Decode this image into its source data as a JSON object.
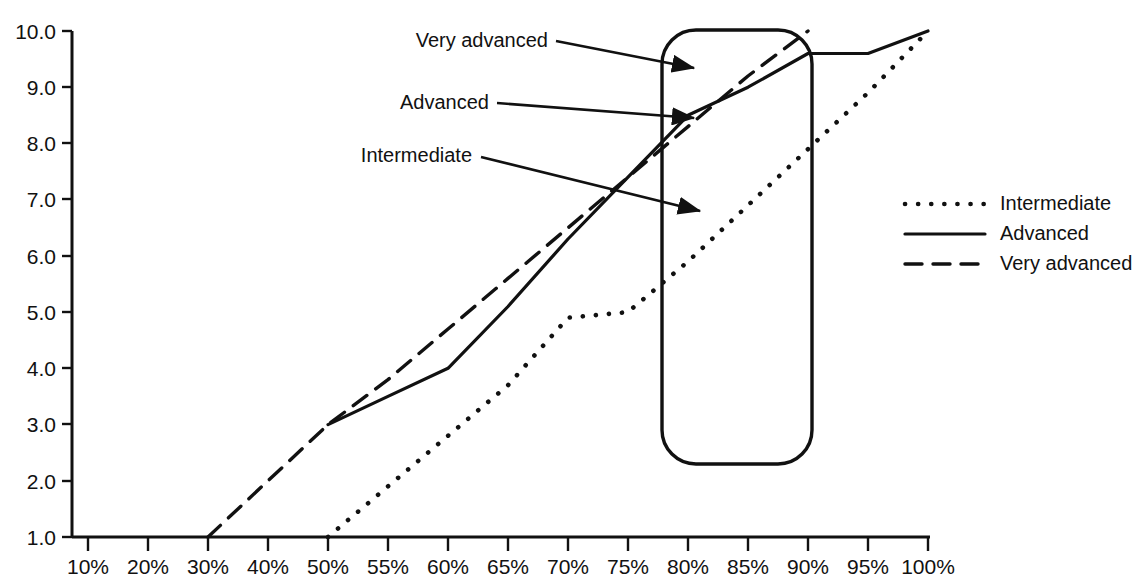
{
  "chart_data": {
    "type": "line",
    "title": "",
    "xlabel": "",
    "ylabel": "",
    "grid": false,
    "legend_position": "right",
    "x_tick_labels": [
      "10%",
      "20%",
      "30%",
      "40%",
      "50%",
      "55%",
      "60%",
      "65%",
      "70%",
      "75%",
      "80%",
      "85%",
      "90%",
      "95%",
      "100%"
    ],
    "y_tick_labels": [
      "1.0",
      "2.0",
      "3.0",
      "4.0",
      "5.0",
      "6.0",
      "7.0",
      "8.0",
      "9.0",
      "10.0"
    ],
    "ylim": [
      1.0,
      10.0
    ],
    "xlim": [
      "10%",
      "100%"
    ],
    "series": [
      {
        "name": "Intermediate",
        "style": "dotted",
        "x": [
          "50%",
          "55%",
          "60%",
          "65%",
          "70%",
          "75%",
          "80%",
          "85%",
          "90%",
          "95%",
          "100%"
        ],
        "values": [
          1.0,
          1.9,
          2.8,
          3.7,
          4.9,
          5.0,
          5.9,
          6.9,
          7.9,
          8.9,
          10.0
        ]
      },
      {
        "name": "Advanced",
        "style": "solid",
        "x": [
          "50%",
          "55%",
          "60%",
          "65%",
          "70%",
          "75%",
          "80%",
          "85%",
          "90%",
          "95%",
          "100%"
        ],
        "values": [
          3.0,
          3.5,
          4.0,
          5.1,
          6.3,
          7.4,
          8.5,
          9.0,
          9.6,
          9.6,
          10.0
        ]
      },
      {
        "name": "Very advanced",
        "style": "dashed",
        "x": [
          "30%",
          "40%",
          "50%",
          "55%",
          "60%",
          "65%",
          "70%",
          "75%",
          "80%",
          "85%",
          "90%"
        ],
        "values": [
          1.0,
          2.0,
          3.0,
          3.8,
          4.7,
          5.6,
          6.5,
          7.4,
          8.3,
          9.2,
          10.0
        ]
      }
    ],
    "annotations": [
      {
        "label": "Very advanced",
        "points_to": {
          "x": "78%",
          "y": 9.55
        }
      },
      {
        "label": "Advanced",
        "points_to": {
          "x": "78%",
          "y": 8.7
        }
      },
      {
        "label": "Intermediate",
        "points_to": {
          "x": "79%",
          "y": 7.05
        }
      }
    ],
    "highlight_region": {
      "x_start": "79%",
      "x_end": "90%",
      "y_start": 2.1,
      "y_end": 10.0
    }
  },
  "legend": {
    "entries": [
      {
        "label": "Intermediate",
        "style": "dotted"
      },
      {
        "label": "Advanced",
        "style": "solid"
      },
      {
        "label": "Very advanced",
        "style": "dashed"
      }
    ]
  }
}
